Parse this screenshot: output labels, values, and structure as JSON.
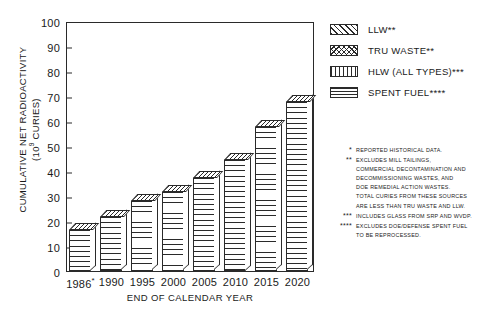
{
  "chart_data": {
    "type": "bar",
    "title": "",
    "subtitle": "",
    "xlabel": "END OF CALENDAR YEAR",
    "ylabel": "CUMULATIVE NET RADIOACTIVITY (10⁹ CURIES)",
    "ylabel_line1": "CUMULATIVE NET RADIOACTIVITY",
    "ylabel_line2_prefix": "(10",
    "ylabel_line2_sup": "9",
    "ylabel_line2_suffix": " CURIES)",
    "categories": [
      "1986*",
      "1990",
      "1995",
      "2000",
      "2005",
      "2010",
      "2015",
      "2020"
    ],
    "category_labels": [
      "1986",
      "1990",
      "1995",
      "2000",
      "2005",
      "2010",
      "2015",
      "2020"
    ],
    "first_category_star": "*",
    "values": [
      17,
      22,
      28.5,
      32,
      37.5,
      45,
      58,
      68
    ],
    "ylim": [
      0,
      100
    ],
    "ytick_values": [
      0,
      10,
      20,
      30,
      40,
      50,
      60,
      70,
      80,
      90,
      100
    ],
    "ytick_labels": [
      "0",
      "10",
      "20",
      "30",
      "40",
      "50",
      "60",
      "70",
      "80",
      "90",
      "100"
    ],
    "grid": false,
    "legend_position": "right",
    "series": [
      {
        "name": "LLW**",
        "pattern": "diagonal-hatch"
      },
      {
        "name": "TRU WASTE**",
        "pattern": "cross-hatch"
      },
      {
        "name": "HLW (ALL TYPES)***",
        "pattern": "vertical-lines"
      },
      {
        "name": "SPENT FUEL****",
        "pattern": "horizontal-lines"
      }
    ]
  },
  "legend": {
    "items": [
      {
        "label": "LLW**",
        "swatch": "diagonal-hatch-swatch"
      },
      {
        "label": "TRU WASTE**",
        "swatch": "cross-hatch-swatch"
      },
      {
        "label": "HLW (ALL TYPES)***",
        "swatch": "vertical-lines-swatch"
      },
      {
        "label": "SPENT FUEL****",
        "swatch": "horizontal-lines-swatch"
      }
    ]
  },
  "footnotes": [
    {
      "marker": "*",
      "lines": [
        "REPORTED HISTORICAL DATA."
      ]
    },
    {
      "marker": "**",
      "lines": [
        "EXCLUDES MILL TAILINGS,",
        "COMMERCIAL DECONTAMINATION AND",
        "DECOMMISSIONING WASTES, AND",
        "DOE REMEDIAL ACTION WASTES.",
        "TOTAL CURIES FROM THESE SOURCES",
        "ARE LESS THAN TRU WASTE AND LLW."
      ]
    },
    {
      "marker": "***",
      "lines": [
        "INCLUDES GLASS FROM SRP AND WVDP."
      ]
    },
    {
      "marker": "****",
      "lines": [
        "EXCLUDES DOE/DEFENSE SPENT FUEL",
        "TO BE REPROCESSED."
      ]
    }
  ],
  "colors": {
    "ink": "#2a2a2a",
    "background": "#ffffff"
  }
}
